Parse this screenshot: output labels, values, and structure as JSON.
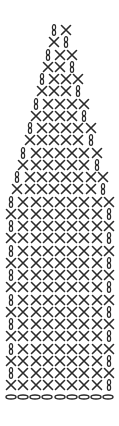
{
  "legend": {
    "X": "single crochet",
    "C": "turning chain (vertical)",
    "F": "foundation chain (horizontal oval)"
  },
  "colors": {
    "ink": "#2a2a2a",
    "background": "#ffffff"
  },
  "layout": {
    "first_row_y": 30,
    "row_spacing": 12.25,
    "col_spacing": 12.2,
    "center_x": 60
  },
  "rows": [
    "CX",
    "XC",
    "CXX",
    "XXC",
    "CXXX",
    "XXXC",
    "CXXXX",
    "XXXXC",
    "CXXXXX",
    "XXXXXC",
    "CXXXXXX",
    "XXXXXXC",
    "CXXXXXXX",
    "XXXXXXXC",
    "CXXXXXXXX",
    "XXXXXXXXC",
    "CXXXXXXXX",
    "XXXXXXXXC",
    "CXXXXXXXX",
    "XXXXXXXXC",
    "CXXXXXXXX",
    "XXXXXXXXC",
    "CXXXXXXXX",
    "XXXXXXXXC",
    "CXXXXXXXX",
    "XXXXXXXXC",
    "CXXXXXXXX",
    "XXXXXXXXC",
    "CXXXXXXXX",
    "XXXXXXXXC"
  ],
  "foundation": {
    "count": 9,
    "symbol": "F"
  }
}
